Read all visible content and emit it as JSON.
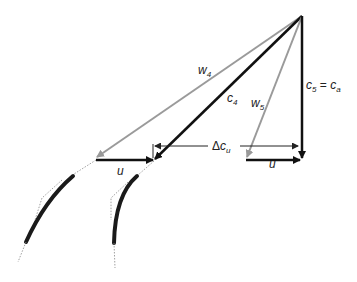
{
  "diagram": {
    "type": "velocity-triangle",
    "labels": {
      "w4": {
        "base": "w",
        "sub": "4"
      },
      "c4": {
        "base": "c",
        "sub": "4"
      },
      "w5": {
        "base": "w",
        "sub": "5"
      },
      "c5_eq_ca": {
        "base": "c",
        "sub": "5",
        "eq": " = ",
        "base2": "c",
        "sub2": "a"
      },
      "delta_cu": {
        "prefix": "Δ",
        "base": "c",
        "sub": "u"
      },
      "u_left": "u",
      "u_right": "u"
    },
    "colors": {
      "absolute_velocity": "#111111",
      "relative_velocity": "#999999",
      "blade": "#1a1a1a",
      "guide_dotted": "#888888"
    }
  }
}
